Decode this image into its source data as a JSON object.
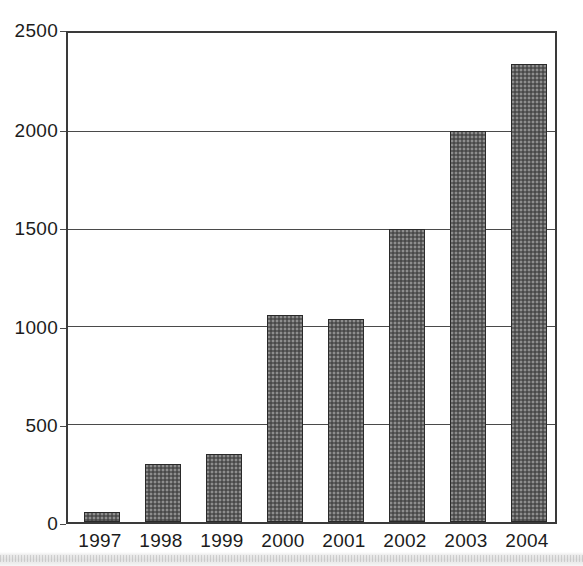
{
  "chart_data": {
    "type": "bar",
    "title": "",
    "subtitle": "",
    "xlabel": "",
    "ylabel": "",
    "categories": [
      "1997",
      "1998",
      "1999",
      "2000",
      "2001",
      "2002",
      "2003",
      "2004"
    ],
    "values": [
      50,
      295,
      350,
      1060,
      1040,
      1500,
      2000,
      2340
    ],
    "series": [
      {
        "name": "",
        "values": [
          50,
          295,
          350,
          1060,
          1040,
          1500,
          2000,
          2340
        ]
      }
    ],
    "ylim": [
      0,
      2500
    ],
    "y_ticks": [
      0,
      500,
      1000,
      1500,
      2000,
      2500
    ],
    "y_tick_labels": [
      "0",
      "500",
      "1000",
      "1500",
      "2000",
      "2500"
    ],
    "x_tick_labels": [
      "1997",
      "1998",
      "1999",
      "2000",
      "2001",
      "2002",
      "2003",
      "2004"
    ],
    "grid": true,
    "grid_axis": "y",
    "legend": false,
    "legend_position": "none",
    "bar_color": "#5d5d5d",
    "bar_edge_color": "#2a2a2a",
    "axis_color": "#3a3a3a",
    "background_color": "#ffffff",
    "annotations": []
  }
}
